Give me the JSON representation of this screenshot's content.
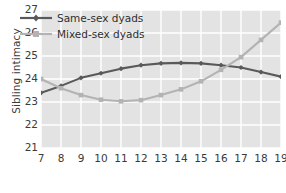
{
  "chart_data": {
    "type": "line",
    "title": "",
    "xlabel": "Age (years)",
    "ylabel": "Sibling intimacy",
    "x": [
      7,
      8,
      9,
      10,
      11,
      12,
      13,
      14,
      15,
      16,
      17,
      18,
      19
    ],
    "categories": [
      "7",
      "8",
      "9",
      "10",
      "11",
      "12",
      "13",
      "14",
      "15",
      "16",
      "17",
      "18",
      "19"
    ],
    "xlim": [
      7,
      19
    ],
    "ylim": [
      21,
      27
    ],
    "yticks": [
      27,
      26,
      25,
      24,
      23,
      22,
      21
    ],
    "ytick_labels": [
      "27",
      "26",
      "25",
      "24",
      "23",
      "22",
      "21"
    ],
    "grid": true,
    "legend_position": "upper-left-inside",
    "series": [
      {
        "name": "Same-sex dyads",
        "color": "#595959",
        "marker": "diamond",
        "values": [
          23.4,
          23.7,
          24.05,
          24.25,
          24.45,
          24.6,
          24.68,
          24.7,
          24.68,
          24.6,
          24.5,
          24.3,
          24.1
        ]
      },
      {
        "name": "Mixed-sex dyads",
        "color": "#b3b3b3",
        "marker": "square",
        "values": [
          24.0,
          23.6,
          23.3,
          23.1,
          23.03,
          23.08,
          23.3,
          23.55,
          23.9,
          24.4,
          24.95,
          25.7,
          26.45
        ]
      }
    ]
  },
  "legend": {
    "items": [
      {
        "label": "Same-sex dyads",
        "color": "#595959"
      },
      {
        "label": "Mixed-sex dyads",
        "color": "#b3b3b3"
      }
    ]
  }
}
